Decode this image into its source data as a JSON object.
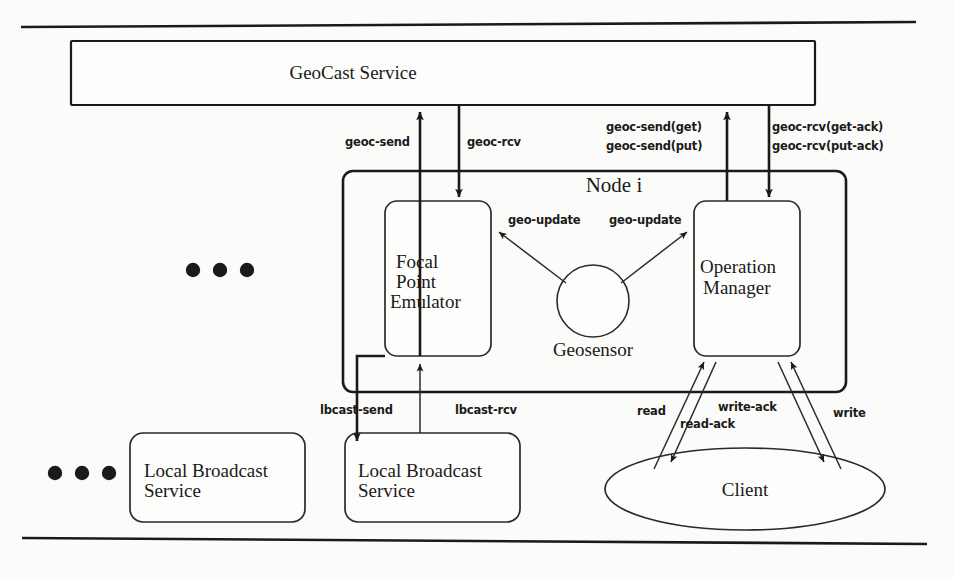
{
  "figure": {
    "background_color": "#fbfbf9",
    "ink_color": "#1a1a1a"
  },
  "nodes": {
    "geocast_service": {
      "label": "GeoCast Service"
    },
    "node_container": {
      "label": "Node i"
    },
    "focal_point_emulator": {
      "line1": "Focal",
      "line2": "Point",
      "line3": "Emulator"
    },
    "operation_manager": {
      "line1": "Operation",
      "line2": "Manager"
    },
    "geosensor": {
      "label": "Geosensor"
    },
    "local_broadcast_service_left": {
      "line1": "Local Broadcast",
      "line2": "Service"
    },
    "local_broadcast_service_right": {
      "line1": "Local Broadcast",
      "line2": "Service"
    },
    "client": {
      "label": "Client"
    }
  },
  "edges": {
    "geoc_send": {
      "label": "geoc-send"
    },
    "geoc_rcv": {
      "label": "geoc-rcv"
    },
    "geoc_send_get": {
      "label": "geoc-send(get)"
    },
    "geoc_send_put": {
      "label": "geoc-send(put)"
    },
    "geoc_rcv_get_ack": {
      "label": "geoc-rcv(get-ack)"
    },
    "geoc_rcv_put_ack": {
      "label": "geoc-rcv(put-ack)"
    },
    "geo_update_left": {
      "label": "geo-update"
    },
    "geo_update_right": {
      "label": "geo-update"
    },
    "lbcast_send": {
      "label": "lbcast-send"
    },
    "lbcast_rcv": {
      "label": "lbcast-rcv"
    },
    "read": {
      "label": "read"
    },
    "read_ack": {
      "label": "read-ack"
    },
    "write_ack": {
      "label": "write-ack"
    },
    "write": {
      "label": "write"
    }
  },
  "ellipsis": {
    "upper": "• • •",
    "lower": "• • •"
  }
}
